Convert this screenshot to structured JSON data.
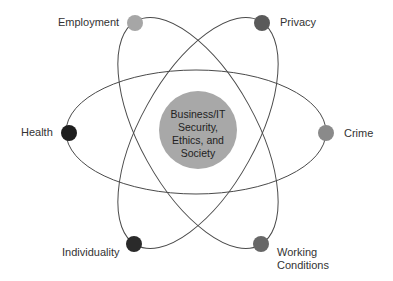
{
  "diagram": {
    "type": "orbital",
    "center": {
      "lines": [
        "Business/IT",
        "Security,",
        "Ethics, and",
        "Society"
      ],
      "color": "#a8a8a8"
    },
    "orbit_color": "#4a4a4a",
    "nodes": [
      {
        "id": "employment",
        "label": "Employment",
        "color": "#a6a6a6"
      },
      {
        "id": "privacy",
        "label": "Privacy",
        "color": "#5a5a5a"
      },
      {
        "id": "health",
        "label": "Health",
        "color": "#1e1e1e"
      },
      {
        "id": "crime",
        "label": "Crime",
        "color": "#8a8a8a"
      },
      {
        "id": "individuality",
        "label": "Individuality",
        "color": "#2a2a2a"
      },
      {
        "id": "working_conditions",
        "label_lines": [
          "Working",
          "Conditions"
        ],
        "color": "#676767"
      }
    ]
  }
}
